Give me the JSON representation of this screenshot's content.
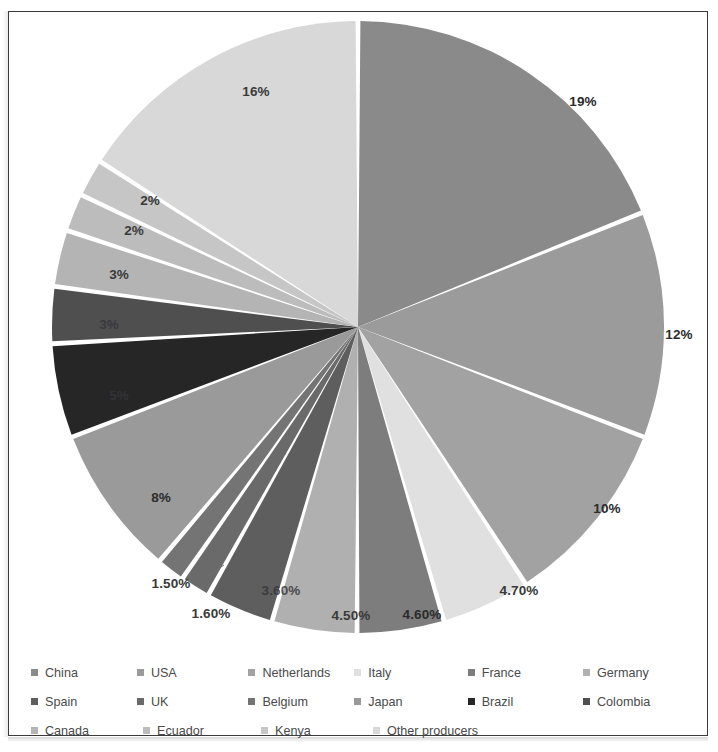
{
  "chart_data": {
    "type": "pie",
    "title": "",
    "start_angle_deg": 0,
    "direction": "clockwise",
    "legend_position": "bottom",
    "grid": false,
    "categories": [
      "China",
      "USA",
      "Netherlands",
      "Italy",
      "France",
      "Germany",
      "Spain",
      "UK",
      "Belgium",
      "Japan",
      "Brazil",
      "Colombia",
      "Canada",
      "Ecuador",
      "Kenya",
      "Other producers"
    ],
    "values": [
      19,
      12,
      10,
      4.7,
      4.6,
      4.5,
      3.6,
      1.6,
      1.5,
      8,
      5,
      3,
      3,
      2,
      2,
      16
    ],
    "labels": [
      "19%",
      "12%",
      "10%",
      "4.70%",
      "4.60%",
      "4.50%",
      "3.60%",
      "1.60%",
      "1.50%",
      "8%",
      "5%",
      "3%",
      "3%",
      "2%",
      "2%",
      "16%"
    ],
    "colors": [
      "#8a8a8a",
      "#9b9b9b",
      "#a2a2a2",
      "#e0e0e0",
      "#7d7d7d",
      "#b0b0b0",
      "#5e5e5e",
      "#6a6a6a",
      "#747474",
      "#9a9a9a",
      "#262626",
      "#4f4f4f",
      "#b4b4b4",
      "#bcbcbc",
      "#c6c6c6",
      "#d8d8d8"
    ],
    "slices": [
      {
        "name": "China",
        "label": "19%",
        "value": 19,
        "color": "#8a8a8a",
        "label_x": 574,
        "label_y": 89,
        "label_style": "on-dark"
      },
      {
        "name": "USA",
        "label": "12%",
        "value": 12,
        "color": "#9b9b9b",
        "label_x": 670,
        "label_y": 322,
        "label_style": "on-dark"
      },
      {
        "name": "Netherlands",
        "label": "10%",
        "value": 10,
        "color": "#a2a2a2",
        "label_x": 598,
        "label_y": 496,
        "label_style": "on-dark"
      },
      {
        "name": "Italy",
        "label": "4.70%",
        "value": 4.7,
        "color": "#e0e0e0",
        "label_x": 510,
        "label_y": 578,
        "label_style": "normal"
      },
      {
        "name": "France",
        "label": "4.60%",
        "value": 4.6,
        "color": "#7d7d7d",
        "label_x": 413,
        "label_y": 602,
        "label_style": "on-dark"
      },
      {
        "name": "Germany",
        "label": "4.50%",
        "value": 4.5,
        "color": "#b0b0b0",
        "label_x": 342,
        "label_y": 603,
        "label_style": "normal"
      },
      {
        "name": "Spain",
        "label": "3.60%",
        "value": 3.6,
        "color": "#5e5e5e",
        "label_x": 272,
        "label_y": 578,
        "label_style": "faint"
      },
      {
        "name": "UK",
        "label": "1.60%",
        "value": 1.6,
        "color": "#6a6a6a",
        "label_x": 202,
        "label_y": 601,
        "label_style": "normal"
      },
      {
        "name": "Belgium",
        "label": "1.50%",
        "value": 1.5,
        "color": "#747474",
        "label_x": 162,
        "label_y": 571,
        "label_style": "normal"
      },
      {
        "name": "Japan",
        "label": "8%",
        "value": 8,
        "color": "#9a9a9a",
        "label_x": 152,
        "label_y": 485,
        "label_style": "on-dark"
      },
      {
        "name": "Brazil",
        "label": "5%",
        "value": 5,
        "color": "#262626",
        "label_x": 110,
        "label_y": 383,
        "label_style": "faint"
      },
      {
        "name": "Colombia",
        "label": "3%",
        "value": 3,
        "color": "#4f4f4f",
        "label_x": 100,
        "label_y": 312,
        "label_style": "faint"
      },
      {
        "name": "Canada",
        "label": "3%",
        "value": 3,
        "color": "#b4b4b4",
        "label_x": 110,
        "label_y": 262,
        "label_style": "normal"
      },
      {
        "name": "Ecuador",
        "label": "2%",
        "value": 2,
        "color": "#bcbcbc",
        "label_x": 125,
        "label_y": 218,
        "label_style": "normal"
      },
      {
        "name": "Kenya",
        "label": "2%",
        "value": 2,
        "color": "#c6c6c6",
        "label_x": 141,
        "label_y": 188,
        "label_style": "normal"
      },
      {
        "name": "Other producers",
        "label": "16%",
        "value": 16,
        "color": "#d8d8d8",
        "label_x": 247,
        "label_y": 79,
        "label_style": "normal"
      }
    ],
    "leader_lines": [
      {
        "name": "belgium-leader",
        "x1": 196,
        "y1": 566,
        "x2": 215,
        "y2": 553
      }
    ]
  },
  "legend": {
    "rows": [
      [
        {
          "label": "China",
          "color": "#8a8a8a",
          "width_class": "w1"
        },
        {
          "label": "USA",
          "color": "#9b9b9b",
          "width_class": "w2"
        },
        {
          "label": "Netherlands",
          "color": "#a2a2a2",
          "width_class": "w3"
        },
        {
          "label": "Italy",
          "color": "#e0e0e0",
          "width_class": "w4"
        },
        {
          "label": "France",
          "color": "#7d7d7d",
          "width_class": "w5"
        },
        {
          "label": "Germany",
          "color": "#b0b0b0",
          "width_class": "w6"
        }
      ],
      [
        {
          "label": "Spain",
          "color": "#5e5e5e",
          "width_class": "w1"
        },
        {
          "label": "UK",
          "color": "#6a6a6a",
          "width_class": "w2"
        },
        {
          "label": "Belgium",
          "color": "#747474",
          "width_class": "w3"
        },
        {
          "label": "Japan",
          "color": "#9a9a9a",
          "width_class": "w4"
        },
        {
          "label": "Brazil",
          "color": "#262626",
          "width_class": "w5"
        },
        {
          "label": "Colombia",
          "color": "#4f4f4f",
          "width_class": "w6"
        }
      ],
      [
        {
          "label": "Canada",
          "color": "#b4b4b4",
          "width_class": "w1"
        },
        {
          "label": "Ecuador",
          "color": "#bcbcbc",
          "width_class": "w2"
        },
        {
          "label": "Kenya",
          "color": "#c6c6c6",
          "width_class": "w3"
        },
        {
          "label": "Other producers",
          "color": "#d8d8d8",
          "width_class": "w4"
        }
      ]
    ]
  },
  "style": {
    "border_color": "#3b3b3b",
    "background": "#ffffff",
    "slice_gap_color": "#ffffff",
    "label_color": "#3a3a3a"
  }
}
